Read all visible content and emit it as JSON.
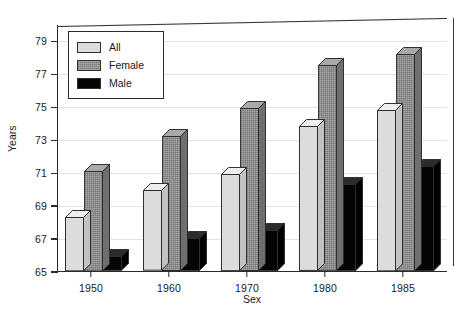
{
  "chart_data": {
    "type": "bar",
    "title": "",
    "xlabel": "Sex",
    "ylabel": "Years",
    "categories": [
      "1950",
      "1960",
      "1970",
      "1980",
      "1985"
    ],
    "series": [
      {
        "name": "All",
        "color": "#dcdcdc",
        "values": [
          68.3,
          69.9,
          70.9,
          73.8,
          74.8
        ]
      },
      {
        "name": "Female",
        "color": "#8f8f8f",
        "values": [
          71.1,
          73.2,
          74.9,
          77.5,
          78.2
        ]
      },
      {
        "name": "Male",
        "color": "#050505",
        "values": [
          65.9,
          67.0,
          67.5,
          70.3,
          71.4
        ]
      }
    ],
    "ylim": [
      65,
      80
    ],
    "yticks": [
      65,
      67,
      69,
      71,
      73,
      75,
      77,
      79
    ],
    "ytick_labels": [
      "65",
      "67",
      "69",
      "71",
      "73",
      "75",
      "77",
      "79"
    ],
    "grid": true,
    "legend_position": "top-left",
    "style_3d": true
  },
  "legend": {
    "entries": [
      {
        "label": "All"
      },
      {
        "label": "Female"
      },
      {
        "label": "Male"
      }
    ]
  },
  "axes": {
    "y_title": "Years",
    "x_title": "Sex"
  }
}
